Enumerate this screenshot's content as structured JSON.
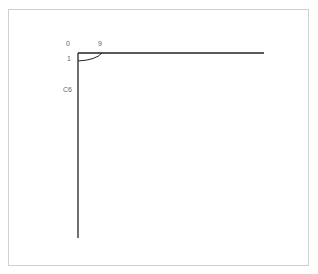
{
  "diagram": {
    "labels": {
      "top_left": "0",
      "top_right": "9",
      "left_upper": "1",
      "left_mid": "C6"
    },
    "line_color": "#222222",
    "border_color": "#cfcfcf"
  }
}
